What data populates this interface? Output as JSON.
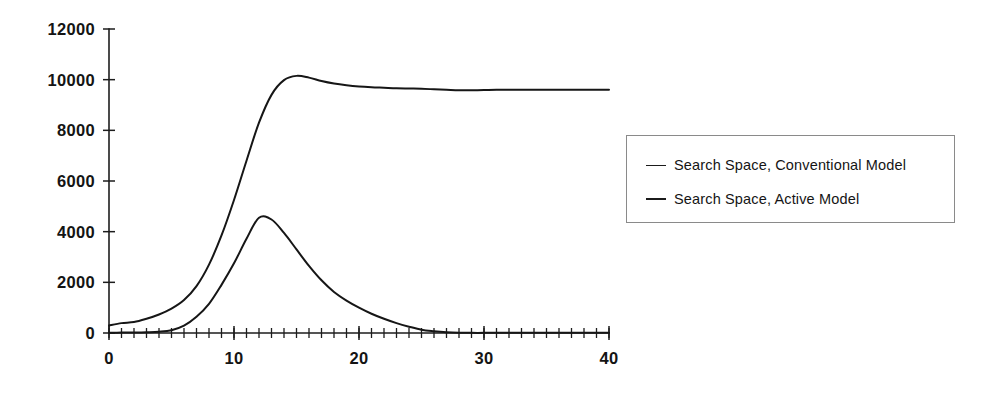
{
  "chart_data": {
    "type": "line",
    "title": "",
    "subtitle": "",
    "xlabel": "",
    "ylabel": "",
    "xlim": [
      0,
      40
    ],
    "ylim": [
      0,
      12000
    ],
    "grid": false,
    "legend_position": "right",
    "x_ticks_major": [
      0,
      10,
      20,
      30,
      40
    ],
    "x_tick_labels": [
      "0",
      "10",
      "20",
      "30",
      "40"
    ],
    "x_minor_tick_step": 1,
    "y_ticks_major": [
      0,
      2000,
      4000,
      6000,
      8000,
      10000,
      12000
    ],
    "y_tick_labels": [
      "0",
      "2000",
      "4000",
      "6000",
      "8000",
      "10000",
      "12000"
    ],
    "x": [
      0,
      1,
      2,
      3,
      4,
      5,
      6,
      7,
      8,
      9,
      10,
      11,
      12,
      13,
      14,
      15,
      16,
      17,
      18,
      19,
      20,
      21,
      22,
      23,
      24,
      25,
      26,
      27,
      28,
      29,
      30,
      31,
      32,
      33,
      34,
      35,
      36,
      37,
      38,
      39,
      40
    ],
    "series": [
      {
        "name": "Search Space, Conventional Model",
        "color": "#161616",
        "values": [
          300,
          390,
          430,
          560,
          730,
          960,
          1300,
          1850,
          2700,
          3850,
          5250,
          6800,
          8300,
          9400,
          9980,
          10150,
          10080,
          9950,
          9850,
          9780,
          9730,
          9700,
          9680,
          9660,
          9650,
          9640,
          9620,
          9600,
          9580,
          9580,
          9590,
          9600,
          9600,
          9600,
          9600,
          9600,
          9600,
          9600,
          9600,
          9600,
          9600
        ]
      },
      {
        "name": "Search Space, Active Model",
        "color": "#161616",
        "values": [
          10,
          15,
          20,
          30,
          50,
          110,
          290,
          640,
          1150,
          1900,
          2750,
          3720,
          4550,
          4480,
          3950,
          3300,
          2650,
          2080,
          1620,
          1280,
          1000,
          760,
          560,
          390,
          250,
          130,
          70,
          30,
          10,
          5,
          5,
          5,
          5,
          5,
          5,
          5,
          5,
          5,
          5,
          5,
          5
        ]
      }
    ]
  },
  "legend": {
    "items": [
      {
        "label": "Search Space, Conventional Model",
        "marker": "line-marker"
      },
      {
        "label": "Search Space, Active Model",
        "marker": "line-marker"
      }
    ]
  }
}
